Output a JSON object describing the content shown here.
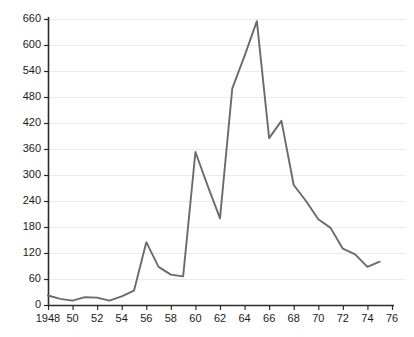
{
  "chart_data": {
    "type": "line",
    "title": "",
    "subtitle": "",
    "xlabel": "",
    "ylabel": "",
    "xlim": [
      1948,
      1976
    ],
    "ylim": [
      0,
      660
    ],
    "grid": true,
    "legend": "none",
    "line_color": "#6b6b6b",
    "axis_color": "#2b2b2b",
    "grid_color": "#e9e9ee",
    "background": "#ffffff",
    "xticks": [
      1948,
      1950,
      1952,
      1954,
      1956,
      1958,
      1960,
      1962,
      1964,
      1966,
      1968,
      1970,
      1972,
      1974,
      1976
    ],
    "xtick_labels": [
      "1948",
      "50",
      "52",
      "54",
      "56",
      "58",
      "60",
      "62",
      "64",
      "66",
      "68",
      "70",
      "72",
      "74",
      "76"
    ],
    "yticks": [
      0,
      60,
      120,
      180,
      240,
      300,
      360,
      420,
      480,
      540,
      600,
      660
    ],
    "ytick_labels": [
      "0",
      "60",
      "120",
      "180",
      "240",
      "300",
      "360",
      "420",
      "480",
      "540",
      "600",
      "660"
    ],
    "x": [
      1948,
      1949,
      1950,
      1951,
      1952,
      1953,
      1954,
      1955,
      1956,
      1957,
      1958,
      1959,
      1960,
      1961,
      1962,
      1963,
      1964,
      1965,
      1966,
      1967,
      1968,
      1969,
      1970,
      1971,
      1972,
      1973,
      1974,
      1975
    ],
    "values": [
      22,
      14,
      10,
      18,
      17,
      10,
      20,
      33,
      145,
      88,
      70,
      66,
      353,
      275,
      200,
      500,
      575,
      655,
      385,
      425,
      277,
      240,
      198,
      178,
      130,
      117,
      88,
      100
    ],
    "series": [
      {
        "name": "series-1",
        "values": [
          22,
          14,
          10,
          18,
          17,
          10,
          20,
          33,
          145,
          88,
          70,
          66,
          353,
          275,
          200,
          500,
          575,
          655,
          385,
          425,
          277,
          240,
          198,
          178,
          130,
          117,
          88,
          100
        ]
      }
    ]
  }
}
